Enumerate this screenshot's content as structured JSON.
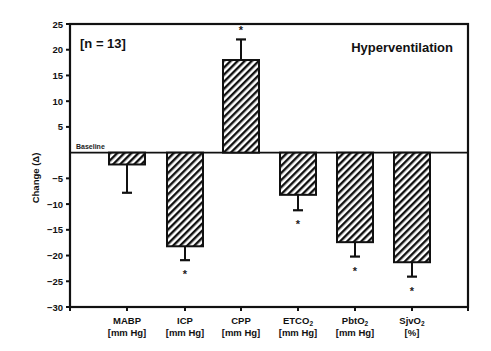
{
  "chart_data": {
    "type": "bar",
    "title": "Hyperventilation",
    "annotation": "[n = 13]",
    "baseline_label": "Baseline",
    "xlabel": "",
    "ylabel": "Change (Δ)",
    "ylim": [
      -30,
      25
    ],
    "yticks": [
      25,
      20,
      15,
      10,
      5,
      -5,
      -10,
      -15,
      -20,
      -25,
      -30
    ],
    "grid": false,
    "legend": null,
    "categories": [
      "MABP [mm Hg]",
      "ICP [mm Hg]",
      "CPP [mm Hg]",
      "ETCO2 [mm Hg]",
      "PbtO2 [mm Hg]",
      "SjvO2 [%]"
    ],
    "category_lines": [
      {
        "name": "MABP",
        "sub": "",
        "unit": "[mm Hg]"
      },
      {
        "name": "ICP",
        "sub": "",
        "unit": "[mm Hg]"
      },
      {
        "name": "CPP",
        "sub": "",
        "unit": "[mm Hg]"
      },
      {
        "name": "ETCO",
        "sub": "2",
        "unit": "[mm Hg]"
      },
      {
        "name": "PbtO",
        "sub": "2",
        "unit": "[mm Hg]"
      },
      {
        "name": "SjvO",
        "sub": "2",
        "unit": "[%]"
      }
    ],
    "values": [
      -2.3,
      -18.2,
      18.0,
      -8.2,
      -17.4,
      -21.3
    ],
    "error": [
      5.5,
      2.7,
      4.0,
      3.0,
      2.8,
      2.8
    ],
    "significant": [
      false,
      true,
      true,
      true,
      true,
      true
    ],
    "significance_marker": "*"
  }
}
